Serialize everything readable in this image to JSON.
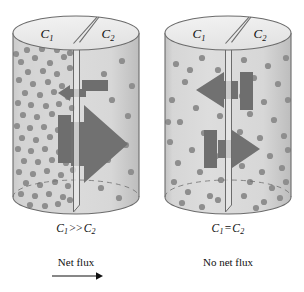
{
  "figure": {
    "type": "diagram",
    "panels": [
      {
        "id": "left",
        "top_left_label": "C",
        "top_left_sub": "1",
        "top_right_label": "C",
        "top_right_sub": "2",
        "caption_lhs": "C",
        "caption_lhs_sub": "1",
        "caption_op": ">>",
        "caption_rhs": "C",
        "caption_rhs_sub": "2",
        "flux_text": "Net flux",
        "has_flux_arrow": true,
        "left_compartment_dot_count": 86,
        "right_compartment_dot_count": 11,
        "forward_arrow_size": "large",
        "backward_arrow_size": "small"
      },
      {
        "id": "right",
        "top_left_label": "C",
        "top_left_sub": "1",
        "top_right_label": "C",
        "top_right_sub": "2",
        "caption_lhs": "C",
        "caption_lhs_sub": "1",
        "caption_op": "=",
        "caption_rhs": "C",
        "caption_rhs_sub": "2",
        "flux_text": "No net flux",
        "has_flux_arrow": false,
        "left_compartment_dot_count": 24,
        "right_compartment_dot_count": 26,
        "forward_arrow_size": "medium",
        "backward_arrow_size": "medium"
      }
    ],
    "colors": {
      "solution_fill": "#d9d9d9",
      "solution_fill_light": "#e4e4e4",
      "cylinder_top_fill": "#ededed",
      "dot_color": "#8e8e8e",
      "arrow_color": "#717171",
      "membrane_block": "#6e6e6e",
      "outline": "#6b6b6b",
      "text_color": "#111111",
      "page_background": "#ffffff"
    }
  }
}
